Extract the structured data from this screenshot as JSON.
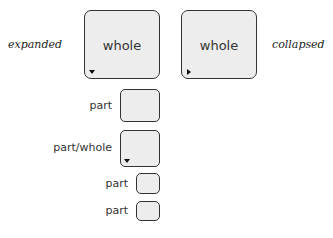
{
  "labels": {
    "expanded": "expanded",
    "collapsed": "collapsed"
  },
  "boxes": {
    "expanded_whole": "whole",
    "collapsed_whole": "whole"
  },
  "rows": [
    {
      "label": "part",
      "toggle": "none"
    },
    {
      "label": "part/whole",
      "toggle": "expanded-triangle"
    },
    {
      "label": "part",
      "toggle": "none"
    },
    {
      "label": "part",
      "toggle": "none"
    }
  ],
  "colors": {
    "box_fill": "#ededed",
    "box_border": "#333333"
  }
}
